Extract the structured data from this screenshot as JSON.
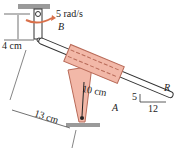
{
  "figure": {
    "labels": {
      "angular_velocity": "5 rad/s",
      "point_b": "B",
      "vertical_offset": "4 cm",
      "arm_length": "10 cm",
      "point_a": "A",
      "horizontal_distance": "13 cm",
      "rod": "R",
      "slope_rise": "5",
      "slope_run": "12"
    },
    "colors": {
      "collar_fill": "#f2b8a8",
      "collar_stroke": "#b86a58",
      "arrow": "#d9704a",
      "ground": "#9a9a9a",
      "line": "#333333"
    }
  }
}
